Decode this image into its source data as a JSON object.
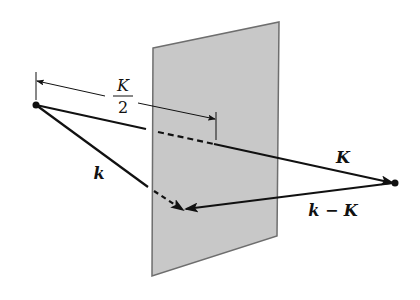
{
  "diagram": {
    "labels": {
      "half_K_numerator": "K",
      "half_K_denominator": "2",
      "K": "K",
      "k": "k",
      "k_minus_K": "k − K"
    },
    "elements": {
      "plane": "Bragg plane (perpendicular bisector of K)",
      "vector_k": "k",
      "vector_K": "K",
      "vector_k_minus_K": "k − K",
      "dimension": "K/2"
    },
    "colors": {
      "plane_fill": "#c8c8c8",
      "plane_edge": "#6e6e6e",
      "ink": "#111111"
    }
  }
}
